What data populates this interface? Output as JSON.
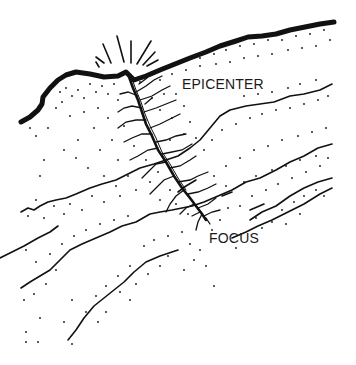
{
  "diagram": {
    "type": "earthquake-cross-section",
    "labels": {
      "epicenter": "EPICENTER",
      "focus": "FOCUS"
    },
    "colors": {
      "ink": "#111111",
      "background": "#ffffff"
    }
  }
}
